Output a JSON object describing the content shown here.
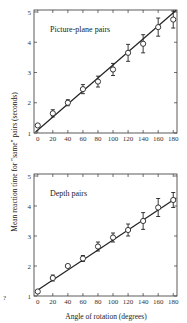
{
  "figure": {
    "ylabel": "Mean reaction time for \"same\" pairs (seconds)",
    "xlabel": "Angle of rotation (degrees)",
    "corner_mark": "?"
  },
  "chart_data": [
    {
      "type": "line",
      "title": "Picture-plane pairs",
      "xlabel": "Angle of rotation (degrees)",
      "ylabel": "Mean reaction time for \"same\" pairs (seconds)",
      "x": [
        0,
        20,
        40,
        60,
        80,
        100,
        120,
        140,
        160,
        180
      ],
      "series": [
        {
          "name": "Picture-plane pairs",
          "values": [
            1.25,
            1.65,
            2.0,
            2.45,
            2.7,
            3.1,
            3.65,
            3.95,
            4.5,
            4.75
          ],
          "error": [
            0.05,
            0.12,
            0.1,
            0.15,
            0.18,
            0.2,
            0.28,
            0.3,
            0.3,
            0.28
          ]
        },
        {
          "name": "Linear fit",
          "values": [
            1.1,
            1.53,
            1.96,
            2.39,
            2.82,
            3.25,
            3.68,
            4.11,
            4.54,
            4.97
          ]
        }
      ],
      "xticks": [
        "0",
        "20",
        "40",
        "60",
        "80",
        "100",
        "120",
        "140",
        "160",
        "180"
      ],
      "yticks": [
        "1",
        "2",
        "3",
        "4",
        "5"
      ],
      "xlim": [
        -5,
        185
      ],
      "ylim": [
        1,
        5
      ],
      "grid": false,
      "marker": "open-circle"
    },
    {
      "type": "line",
      "title": "Depth pairs",
      "xlabel": "Angle of rotation (degrees)",
      "ylabel": "Mean reaction time for \"same\" pairs (seconds)",
      "x": [
        0,
        20,
        40,
        60,
        80,
        100,
        120,
        140,
        160,
        180
      ],
      "series": [
        {
          "name": "Depth pairs",
          "values": [
            1.15,
            1.6,
            2.0,
            2.25,
            2.65,
            2.95,
            3.2,
            3.5,
            3.95,
            4.2
          ],
          "error": [
            0.05,
            0.1,
            0.05,
            0.1,
            0.15,
            0.15,
            0.2,
            0.28,
            0.3,
            0.25
          ]
        },
        {
          "name": "Linear fit",
          "values": [
            1.2,
            1.53,
            1.87,
            2.2,
            2.53,
            2.87,
            3.2,
            3.53,
            3.87,
            4.2
          ]
        }
      ],
      "xticks": [
        "0",
        "20",
        "40",
        "60",
        "80",
        "100",
        "120",
        "140",
        "160",
        "180"
      ],
      "yticks": [
        "1",
        "2",
        "3",
        "4",
        "5"
      ],
      "xlim": [
        -5,
        185
      ],
      "ylim": [
        1,
        5
      ],
      "grid": false,
      "marker": "open-circle"
    }
  ]
}
